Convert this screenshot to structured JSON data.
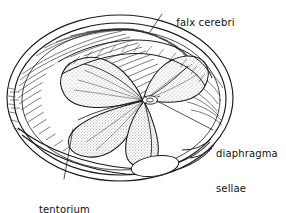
{
  "figure": {
    "kind": "anatomical-line-drawing",
    "background_color": "#ffffff",
    "ink_color": "#1a1a1a",
    "stipple_color": "#6b6b6b",
    "width": 286,
    "height": 213
  },
  "labels": {
    "falx_cerebri": "falx cerebri",
    "diaphragma_sellae_line1": "diaphragma",
    "diaphragma_sellae_line2": "sellae",
    "tentorium_cerebelli_line1": "tentorium",
    "tentorium_cerebelli_line2": "cerebelli"
  },
  "leaders": [
    {
      "name": "falx-cerebri-leader",
      "from": [
        162,
        14
      ],
      "to": [
        150,
        32
      ]
    },
    {
      "name": "diaphragma-sellae-leader",
      "from": [
        213,
        130
      ],
      "to": [
        148,
        101
      ]
    },
    {
      "name": "tentorium-cerebelli-leader",
      "from": [
        64,
        179
      ],
      "to": [
        73,
        129
      ]
    }
  ]
}
